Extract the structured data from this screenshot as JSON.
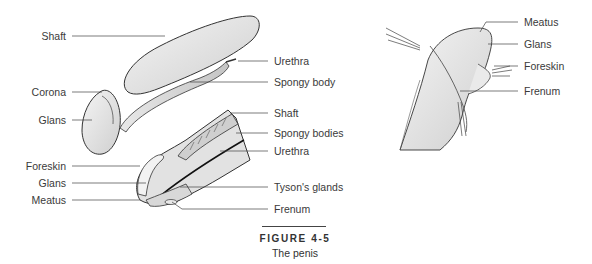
{
  "figure": {
    "number": "FIGURE 4-5",
    "caption": "The penis"
  },
  "left_panel": {
    "top_illustration_labels_left": [
      {
        "id": "shaft",
        "text": "Shaft"
      },
      {
        "id": "corona",
        "text": "Corona"
      },
      {
        "id": "glans",
        "text": "Glans"
      }
    ],
    "top_illustration_labels_right": [
      {
        "id": "urethra",
        "text": "Urethra"
      },
      {
        "id": "spongy-body",
        "text": "Spongy body"
      }
    ],
    "section_labels_left": [
      {
        "id": "foreskin",
        "text": "Foreskin"
      },
      {
        "id": "glans",
        "text": "Glans"
      },
      {
        "id": "meatus",
        "text": "Meatus"
      }
    ],
    "section_labels_right": [
      {
        "id": "shaft",
        "text": "Shaft"
      },
      {
        "id": "spongy-bodies",
        "text": "Spongy bodies"
      },
      {
        "id": "urethra",
        "text": "Urethra"
      },
      {
        "id": "tysons-glands",
        "text": "Tyson's glands"
      },
      {
        "id": "frenum",
        "text": "Frenum"
      }
    ]
  },
  "right_panel": {
    "labels": [
      {
        "id": "meatus",
        "text": "Meatus"
      },
      {
        "id": "glans",
        "text": "Glans"
      },
      {
        "id": "foreskin",
        "text": "Foreskin"
      },
      {
        "id": "frenum",
        "text": "Frenum"
      }
    ]
  },
  "colors": {
    "line": "#333333",
    "fill_light": "#eeeeee",
    "fill_mid": "#d6d6d6",
    "fill_dark": "#bdbdbd",
    "text": "#3a3a3a"
  }
}
